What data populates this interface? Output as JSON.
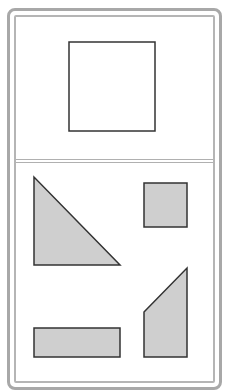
{
  "diagram": {
    "title_region": {
      "shape": "square",
      "fill": "#ffffff",
      "stroke": "#333333"
    },
    "pieces_region": {
      "pieces": [
        {
          "shape": "right-triangle",
          "fill": "#cfcfcf"
        },
        {
          "shape": "small-square",
          "fill": "#cfcfcf"
        },
        {
          "shape": "trapezoid",
          "fill": "#cfcfcf"
        },
        {
          "shape": "rectangle",
          "fill": "#cfcfcf"
        }
      ],
      "stroke": "#333333"
    },
    "frame_color": "#a8a8a8"
  }
}
